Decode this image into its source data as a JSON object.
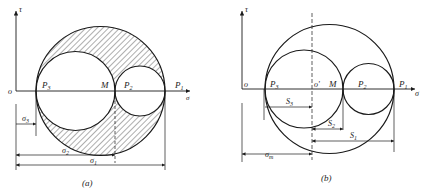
{
  "figure_a": {
    "caption": "(a)",
    "axis_y_label": "τ",
    "origin_label": "o",
    "axis_x_label": "σ",
    "points": {
      "p3": "P",
      "p3_sub": "3",
      "m": "M",
      "p2": "P",
      "p2_sub": "2",
      "p1": "P",
      "p1_sub": "1"
    },
    "dimensions": {
      "sigma3": "σ",
      "sigma3_sub": "3",
      "sigma2": "σ",
      "sigma2_sub": "2",
      "sigma1": "σ",
      "sigma1_sub": "1"
    }
  },
  "figure_b": {
    "caption": "(b)",
    "axis_y_label": "τ",
    "origin_label": "o",
    "center_label": "o'",
    "axis_x_label": "σ",
    "points": {
      "p3": "P",
      "p3_sub": "3",
      "m": "M",
      "p2": "P",
      "p2_sub": "2",
      "p1": "P",
      "p1_sub": "1"
    },
    "dimensions": {
      "s3": "S",
      "s3_sub": "3",
      "s2": "S",
      "s2_sub": "2",
      "s1": "S",
      "s1_sub": "1",
      "sigma_m": "σ",
      "sigma_m_sub": "m"
    }
  },
  "colors": {
    "line": "#1a1a1a",
    "hatch": "#333333",
    "background": "#ffffff"
  }
}
